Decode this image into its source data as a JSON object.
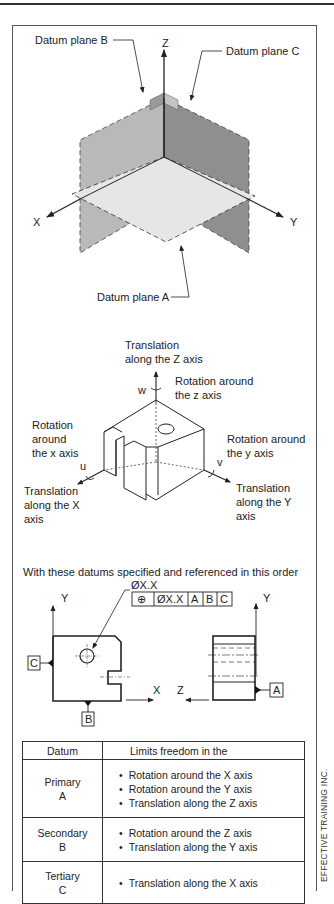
{
  "figure": {
    "credit": "EFFECTIVE TRAINING INC."
  },
  "datum_planes": {
    "axis_z": "Z",
    "axis_x": "X",
    "axis_y": "Y",
    "label_a": "Datum plane A",
    "label_b": "Datum plane B",
    "label_c": "Datum plane C",
    "colors": {
      "plane_b": "#b8b8b8",
      "plane_c": "#8e8e8e",
      "plane_a": "#e4e4e4"
    }
  },
  "degrees_of_freedom": {
    "translation_z": [
      "Translation",
      "along the Z axis"
    ],
    "rotation_z": [
      "Rotation around",
      "the z axis"
    ],
    "rotation_x": [
      "Rotation",
      "around",
      "the x axis"
    ],
    "rotation_y": [
      "Rotation around",
      "the y axis"
    ],
    "translation_x": [
      "Translation",
      "along the X",
      "axis"
    ],
    "translation_y": [
      "Translation",
      "along the Y",
      "axis"
    ],
    "symbol_w": "w",
    "symbol_u": "u",
    "symbol_v": "v"
  },
  "drawing": {
    "caption": "With these datums specified and referenced in this order",
    "hole_callout": "ØX.X",
    "feature_control_frame": {
      "symbol": "⊕",
      "tolerance": "ØX.X",
      "datums": [
        "A",
        "B",
        "C"
      ]
    },
    "front_view": {
      "axis_y": "Y",
      "axis_x": "X",
      "datum_left": "C",
      "datum_bottom": "B"
    },
    "side_view": {
      "axis_y": "Y",
      "axis_z": "Z",
      "datum_right": "A"
    }
  },
  "table": {
    "headers": [
      "Datum",
      "Limits freedom in the"
    ],
    "rows": [
      {
        "datum": "Primary",
        "letter": "A",
        "limits": [
          "Rotation around the X axis",
          "Rotation around the Y axis",
          "Translation along the Z axis"
        ]
      },
      {
        "datum": "Secondary",
        "letter": "B",
        "limits": [
          "Rotation around the Z axis",
          "Translation along the Y axis"
        ]
      },
      {
        "datum": "Tertiary",
        "letter": "C",
        "limits": [
          "Translation along the X axis"
        ]
      }
    ]
  }
}
